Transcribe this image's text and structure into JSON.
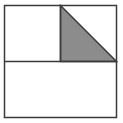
{
  "diagram": {
    "colors": {
      "background": "#ffffff",
      "stroke": "#3a3a3a",
      "shade": "#8c8c8c"
    },
    "outer_square": {
      "x": 4.5,
      "y": 5.5,
      "width": 112,
      "height": 112
    },
    "top_left_square": {
      "x": 4.5,
      "y": 5.5,
      "width": 56,
      "height": 56
    },
    "top_right_square": {
      "x": 60.5,
      "y": 5.5,
      "width": 56,
      "height": 56
    },
    "bottom_rectangle": {
      "x": 4.5,
      "y": 61.5,
      "width": 112,
      "height": 56
    },
    "shaded_triangle": {
      "points": "60.5,5.5 60.5,61.5 116.5,61.5"
    }
  }
}
